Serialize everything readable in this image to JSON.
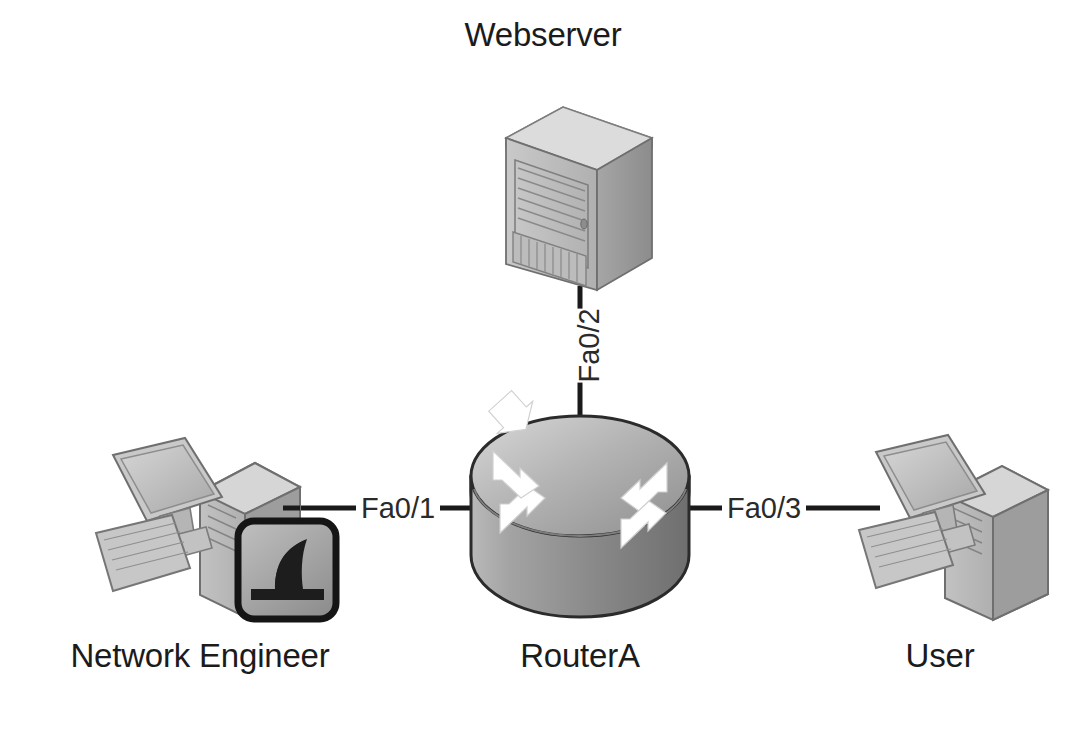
{
  "diagram": {
    "type": "network-topology",
    "background_color": "#ffffff",
    "line_color": "#1a1a1a",
    "text_color": "#1b1b1b",
    "nodes": [
      {
        "id": "webserver",
        "label": "Webserver",
        "icon": "server-tower-icon",
        "position": "top-center"
      },
      {
        "id": "routera",
        "label": "RouterA",
        "icon": "cisco-router-icon",
        "position": "center"
      },
      {
        "id": "network-engineer",
        "label": "Network Engineer",
        "icon": "workstation-wireshark-icon",
        "position": "left",
        "badge": "wireshark-fin-icon"
      },
      {
        "id": "user",
        "label": "User",
        "icon": "workstation-icon",
        "position": "right"
      }
    ],
    "links": [
      {
        "id": "link-fa0-1",
        "label": "Fa0/1",
        "from": "network-engineer",
        "to": "routera",
        "orientation": "horizontal"
      },
      {
        "id": "link-fa0-2",
        "label": "Fa0/2",
        "from": "routera",
        "to": "webserver",
        "orientation": "vertical"
      },
      {
        "id": "link-fa0-3",
        "label": "Fa0/3",
        "from": "routera",
        "to": "user",
        "orientation": "horizontal"
      }
    ]
  }
}
